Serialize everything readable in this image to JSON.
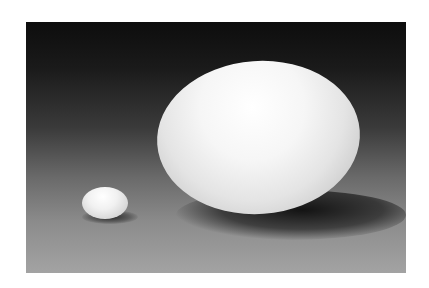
{
  "image": {
    "subject": "A large egg and a small egg on a dark-to-light gradient backdrop",
    "objects": [
      {
        "name": "large-egg",
        "color": "#f4f4f4"
      },
      {
        "name": "small-egg",
        "color": "#efefef"
      }
    ],
    "background": {
      "top_color": "#0d0d0d",
      "bottom_color": "#a3a3a3"
    },
    "border_color": "#ffffff"
  }
}
